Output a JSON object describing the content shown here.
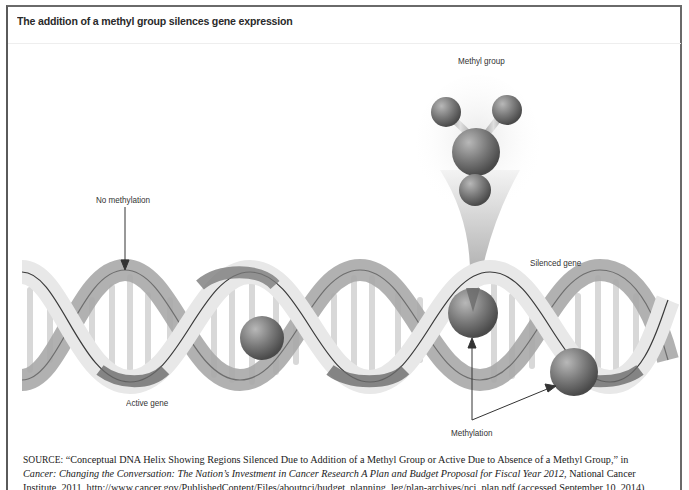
{
  "figure": {
    "title": "The addition of a methyl group silences gene expression",
    "labels": {
      "methyl_group": "Methyl group",
      "no_methylation": "No methylation",
      "silenced_gene": "Silenced gene",
      "active_gene": "Active gene",
      "methylation": "Methylation"
    }
  },
  "source": {
    "prefix": "SOURCE:",
    "line1": "“Conceptual DNA Helix Showing Regions Silenced Due to Addition of a Methyl Group or Active Due to Absence of a Methyl Group,” in",
    "line2_italic": "Cancer: Changing the Conversation: The Nation’s Investment in Cancer Research A Plan and Budget Proposal for Fiscal Year 2012",
    "line2_rest": ", National Cancer",
    "line3": "Institute, 2011, http://www.cancer.gov/PublishedContent/Files/aboutnci/budget_planning_leg/plan-archives/nci_plan.pdf (accessed September 10, 2014)"
  },
  "colors": {
    "frame": "#5a5a5a",
    "strand_light": "#e6e6e6",
    "strand_mid": "#a8a8a8",
    "strand_dark": "#6e6e6e",
    "methyl_sphere": "#7a7a7a"
  }
}
